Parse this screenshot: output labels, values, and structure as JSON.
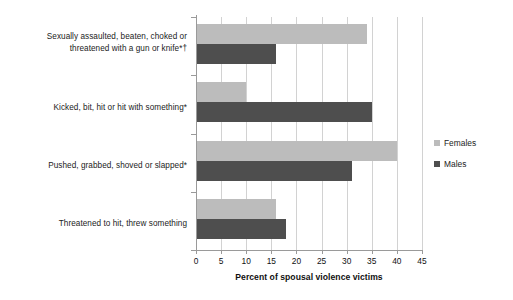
{
  "chart_data": {
    "type": "bar",
    "orientation": "horizontal",
    "title": "",
    "xlabel": "Percent of spousal violence victims",
    "ylabel": "",
    "xlim": [
      0,
      45
    ],
    "xticks": [
      "0",
      "5",
      "10",
      "15",
      "20",
      "25",
      "30",
      "35",
      "40",
      "45"
    ],
    "grid": "vertical",
    "legend_position": "right",
    "categories": [
      "Sexually assaulted, beaten, choked or threatened with a gun or knife*†",
      "Kicked, bit, hit or hit with something*",
      "Pushed, grabbed, shoved or slapped*",
      "Threatened to hit, threw something"
    ],
    "category_lines": [
      [
        "Sexually assaulted, beaten, choked or",
        "threatened with a gun or knife*†"
      ],
      [
        "Kicked, bit, hit or hit with something*"
      ],
      [
        "Pushed, grabbed, shoved or slapped*"
      ],
      [
        "Threatened to hit, threw something"
      ]
    ],
    "series": [
      {
        "name": "Females",
        "color": "#bcbcbc",
        "values": [
          34,
          10,
          40,
          16
        ]
      },
      {
        "name": "Males",
        "color": "#4e4e4e",
        "values": [
          16,
          35,
          31,
          18
        ]
      }
    ]
  },
  "legend": {
    "items": [
      {
        "label": "Females",
        "swatch": "legend-swatch-females"
      },
      {
        "label": "Males",
        "swatch": "legend-swatch-males"
      }
    ]
  },
  "axis": {
    "x_title": "Percent of spousal violence victims"
  }
}
